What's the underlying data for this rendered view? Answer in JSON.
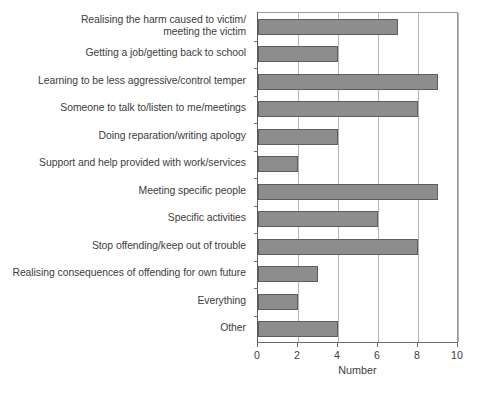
{
  "chart_data": {
    "type": "bar",
    "orientation": "horizontal",
    "title": "",
    "subtitle": "",
    "xlabel": "Number",
    "ylabel": "",
    "xlim": [
      0,
      10
    ],
    "xticks": [
      0,
      2,
      4,
      6,
      8,
      10
    ],
    "xtick_labels": [
      "0",
      "2",
      "4",
      "6",
      "8",
      "10"
    ],
    "grid": "vertical",
    "legend": "none",
    "bar_color": "#8d8d8d",
    "bar_edge_color": "#5e5e5e",
    "categories": [
      "Realising the harm caused to victim/\nmeeting the victim",
      "Getting a job/getting back to school",
      "Learning to be less aggressive/control temper",
      "Someone to talk to/listen to me/meetings",
      "Doing reparation/writing apology",
      "Support and help provided with work/services",
      "Meeting specific people",
      "Specific activities",
      "Stop offending/keep out of trouble",
      "Realising consequences of offending for own future",
      "Everything",
      "Other"
    ],
    "values": [
      7,
      4,
      9,
      8,
      4,
      2,
      9,
      6,
      8,
      3,
      2,
      4
    ]
  }
}
